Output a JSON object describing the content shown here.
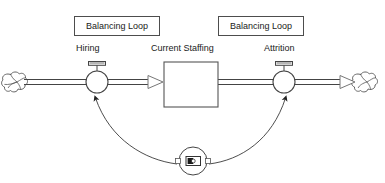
{
  "diagram": {
    "type": "stock-and-flow",
    "title": "",
    "stroke_color": "#333333",
    "fill_color": "#ffffff",
    "text_color": "#1a1a1a",
    "box_border_color": "#4d4d4d",
    "loop_labels": [
      {
        "text": "Balancing Loop",
        "x": 74,
        "y": 16,
        "w": 86,
        "h": 20
      },
      {
        "text": "Balancing Loop",
        "x": 218,
        "y": 16,
        "w": 86,
        "h": 20
      }
    ],
    "node_labels": [
      {
        "text": "Hiring",
        "x": 76,
        "y": 44
      },
      {
        "text": "Current Staffing",
        "x": 151,
        "y": 44
      },
      {
        "text": "Attrition",
        "x": 264,
        "y": 44
      }
    ],
    "stock": {
      "name": "Current Staffing",
      "x": 164,
      "y": 62,
      "w": 54,
      "h": 45
    },
    "flows": [
      {
        "name": "Hiring",
        "valve_cx": 97,
        "valve_cy": 82,
        "valve_r": 11
      },
      {
        "name": "Attrition",
        "valve_cx": 284,
        "valve_cy": 82,
        "valve_r": 11
      }
    ],
    "clouds": [
      {
        "name": "source-cloud",
        "cx": 17,
        "cy": 82,
        "r": 14
      },
      {
        "name": "sink-cloud",
        "cx": 367,
        "cy": 82,
        "r": 14
      }
    ],
    "comparator": {
      "name": "comparator-node",
      "cx": 193,
      "cy": 161,
      "r": 14,
      "icon": "contrast-icon"
    },
    "connectors": [
      {
        "from": "comparator",
        "to": "Hiring",
        "polarity": ""
      },
      {
        "from": "comparator",
        "to": "Attrition",
        "polarity": ""
      }
    ]
  }
}
